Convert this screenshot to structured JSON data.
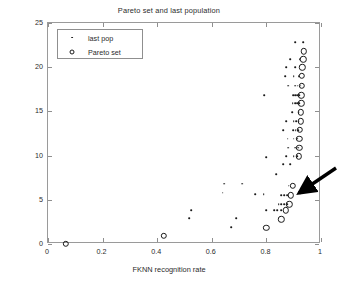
{
  "chart_data": {
    "type": "scatter",
    "title": "Pareto set and last population",
    "xlabel": "FKNN recognition rate",
    "ylabel": "Number of used features, m",
    "xlim": [
      0,
      1
    ],
    "ylim": [
      0,
      25
    ],
    "xticks": [
      0,
      0.2,
      0.4,
      0.6,
      0.8,
      1
    ],
    "xtick_labels": [
      "0",
      "0.2",
      "0.4",
      "0.6",
      "0.8",
      "1"
    ],
    "yticks": [
      0,
      5,
      10,
      15,
      20,
      25
    ],
    "ytick_labels": [
      "0",
      "5",
      "10",
      "15",
      "20",
      "25"
    ],
    "grid": false,
    "legend_position": "upper left",
    "series": [
      {
        "name": "last pop",
        "marker": "dot",
        "color": "#1a1a1a",
        "points": [
          [
            0.905,
            22.8
          ],
          [
            0.935,
            22.8
          ],
          [
            0.888,
            20.9
          ],
          [
            0.922,
            20.9
          ],
          [
            0.872,
            20.0
          ],
          [
            0.905,
            20.0
          ],
          [
            0.868,
            19.0
          ],
          [
            0.9,
            19.0
          ],
          [
            0.918,
            19.0
          ],
          [
            0.88,
            17.9
          ],
          [
            0.905,
            17.9
          ],
          [
            0.915,
            17.9
          ],
          [
            0.925,
            17.9
          ],
          [
            0.792,
            16.8
          ],
          [
            0.898,
            16.8
          ],
          [
            0.906,
            16.8
          ],
          [
            0.913,
            16.8
          ],
          [
            0.92,
            16.8
          ],
          [
            0.896,
            15.9
          ],
          [
            0.905,
            15.9
          ],
          [
            0.912,
            15.9
          ],
          [
            0.92,
            15.9
          ],
          [
            0.895,
            14.9
          ],
          [
            0.918,
            14.9
          ],
          [
            0.872,
            13.9
          ],
          [
            0.9,
            13.9
          ],
          [
            0.91,
            13.9
          ],
          [
            0.918,
            13.9
          ],
          [
            0.862,
            12.9
          ],
          [
            0.898,
            12.9
          ],
          [
            0.908,
            12.9
          ],
          [
            0.916,
            12.9
          ],
          [
            0.878,
            11.9
          ],
          [
            0.9,
            11.9
          ],
          [
            0.912,
            11.9
          ],
          [
            0.88,
            10.9
          ],
          [
            0.905,
            10.9
          ],
          [
            0.916,
            10.9
          ],
          [
            0.872,
            9.9
          ],
          [
            0.9,
            9.9
          ],
          [
            0.912,
            9.9
          ],
          [
            0.8,
            9.8
          ],
          [
            0.862,
            9.0
          ],
          [
            0.888,
            9.0
          ],
          [
            0.835,
            7.9
          ],
          [
            0.645,
            6.8
          ],
          [
            0.712,
            6.8
          ],
          [
            0.882,
            6.6
          ],
          [
            0.64,
            5.8
          ],
          [
            0.76,
            5.6
          ],
          [
            0.79,
            5.6
          ],
          [
            0.855,
            5.5
          ],
          [
            0.866,
            5.5
          ],
          [
            0.876,
            5.5
          ],
          [
            0.845,
            4.5
          ],
          [
            0.855,
            4.5
          ],
          [
            0.866,
            4.5
          ],
          [
            0.876,
            4.5
          ],
          [
            0.8,
            3.8
          ],
          [
            0.828,
            3.8
          ],
          [
            0.84,
            3.8
          ],
          [
            0.855,
            3.8
          ],
          [
            0.525,
            3.8
          ],
          [
            0.518,
            2.9
          ],
          [
            0.69,
            2.9
          ],
          [
            0.672,
            1.9
          ]
        ]
      },
      {
        "name": "Pareto set",
        "marker": "circle",
        "color": "#1a1a1a",
        "points": [
          [
            0.938,
            21.8
          ],
          [
            0.935,
            20.9
          ],
          [
            0.932,
            20.0
          ],
          [
            0.93,
            19.0
          ],
          [
            0.93,
            17.9
          ],
          [
            0.928,
            16.8
          ],
          [
            0.928,
            15.9
          ],
          [
            0.925,
            14.9
          ],
          [
            0.925,
            13.9
          ],
          [
            0.922,
            12.9
          ],
          [
            0.92,
            11.9
          ],
          [
            0.92,
            10.9
          ],
          [
            0.918,
            9.9
          ],
          [
            0.896,
            6.6
          ],
          [
            0.89,
            5.5
          ],
          [
            0.884,
            4.5
          ],
          [
            0.872,
            3.8
          ],
          [
            0.855,
            2.8
          ],
          [
            0.8,
            1.8
          ],
          [
            0.425,
            0.95
          ],
          [
            0.065,
            0.0
          ]
        ]
      }
    ],
    "annotations": [
      {
        "name": "pareto-arrow",
        "type": "arrow",
        "points_to": [
          0.896,
          6.6
        ]
      }
    ]
  }
}
